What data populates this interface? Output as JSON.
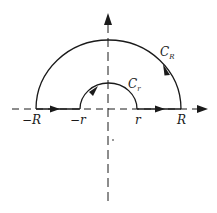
{
  "diagram": {
    "type": "contour-integration",
    "colors": {
      "stroke": "#1a1a1a",
      "background": "#ffffff"
    },
    "axes": {
      "horizontal": {
        "style": "dashed",
        "arrow": "right"
      },
      "vertical": {
        "style": "dashed",
        "arrow": "up"
      }
    },
    "labels": {
      "neg_R": "−R",
      "neg_r": "−r",
      "pos_r": "r",
      "pos_R": "R",
      "big_arc": {
        "main": "C",
        "sub": "R"
      },
      "small_arc": {
        "main": "C",
        "sub": "r"
      }
    },
    "contours": [
      {
        "name": "segment [-R,-r]",
        "direction": "right"
      },
      {
        "name": "C_r",
        "shape": "small semicircle",
        "direction": "clockwise"
      },
      {
        "name": "segment [r,R]",
        "direction": "right"
      },
      {
        "name": "C_R",
        "shape": "large semicircle",
        "direction": "counterclockwise"
      }
    ]
  }
}
